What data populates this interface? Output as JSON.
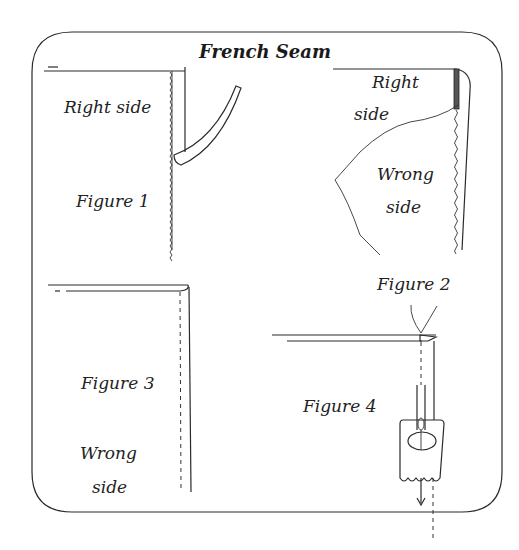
{
  "diagram": {
    "title": "French Seam",
    "frame_color": "#3a3a3a",
    "ink_color": "#222222",
    "background": "#ffffff",
    "figures": [
      {
        "id": "figure-1",
        "label": "Figure 1",
        "texts": [
          "Right side"
        ]
      },
      {
        "id": "figure-2",
        "label": "Figure 2",
        "texts": [
          "Right",
          "side",
          "Wrong",
          "side"
        ]
      },
      {
        "id": "figure-3",
        "label": "Figure 3",
        "texts": [
          "Wrong",
          "side"
        ]
      },
      {
        "id": "figure-4",
        "label": "Figure 4",
        "texts": []
      }
    ]
  }
}
